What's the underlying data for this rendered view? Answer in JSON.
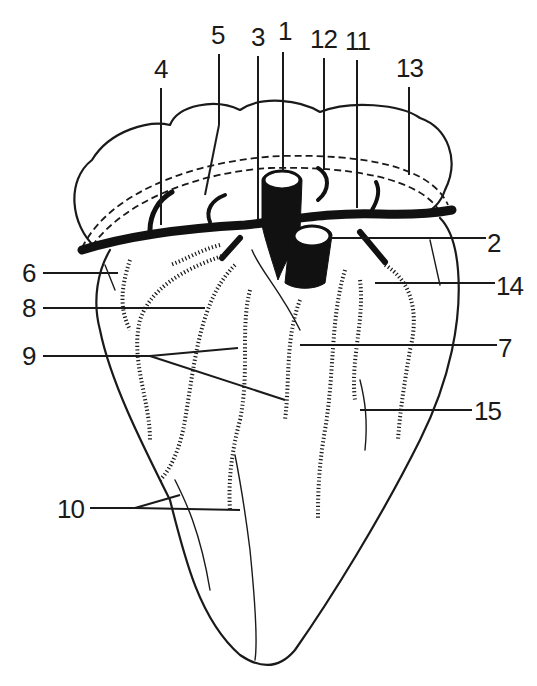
{
  "figure": {
    "colors": {
      "ink": "#1a1a1a",
      "background": "#ffffff"
    },
    "labels": [
      {
        "id": "1",
        "text": "1",
        "x": 278,
        "y": 40
      },
      {
        "id": "2",
        "text": "2",
        "x": 487,
        "y": 252
      },
      {
        "id": "3",
        "text": "3",
        "x": 251,
        "y": 46
      },
      {
        "id": "4",
        "text": "4",
        "x": 154,
        "y": 78
      },
      {
        "id": "5",
        "text": "5",
        "x": 211,
        "y": 44
      },
      {
        "id": "6",
        "text": "6",
        "x": 22,
        "y": 282
      },
      {
        "id": "7",
        "text": "7",
        "x": 498,
        "y": 357
      },
      {
        "id": "8",
        "text": "8",
        "x": 22,
        "y": 317
      },
      {
        "id": "9",
        "text": "9",
        "x": 22,
        "y": 365
      },
      {
        "id": "10",
        "text": "10",
        "x": 57,
        "y": 518
      },
      {
        "id": "11",
        "text": "11",
        "x": 345,
        "y": 50
      },
      {
        "id": "12",
        "text": "12",
        "x": 310,
        "y": 48
      },
      {
        "id": "13",
        "text": "13",
        "x": 396,
        "y": 77
      },
      {
        "id": "14",
        "text": "14",
        "x": 496,
        "y": 295
      },
      {
        "id": "15",
        "text": "15",
        "x": 474,
        "y": 420
      }
    ]
  }
}
